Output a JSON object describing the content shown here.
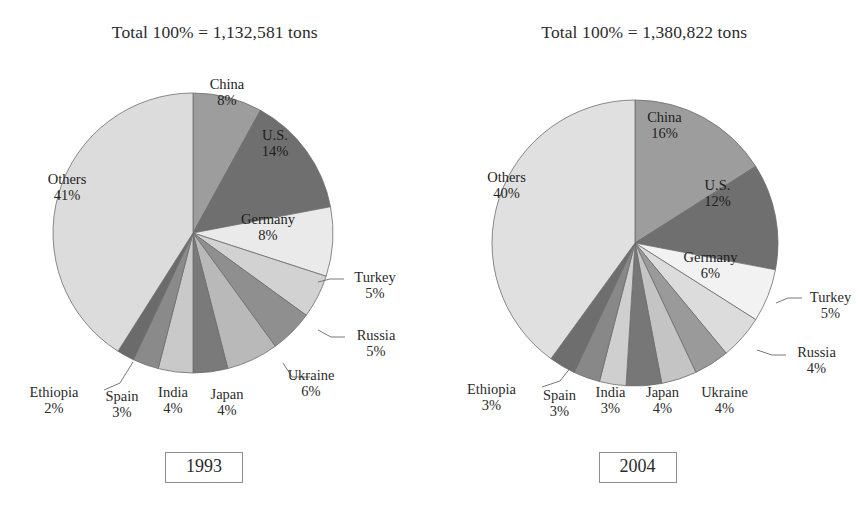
{
  "figure": {
    "background": "#ffffff",
    "text_color": "#2b2b2b"
  },
  "chart_data": [
    {
      "type": "pie",
      "id": "pie-1993",
      "title": "Total 100% = 1,132,581 tons",
      "caption": "1993",
      "total_tons": "1,132,581",
      "start_angle_deg": 0,
      "direction": "clockwise",
      "categories": [
        "China",
        "U.S.",
        "Germany",
        "Turkey",
        "Russia",
        "Ukraine",
        "Japan",
        "India",
        "Spain",
        "Ethiopia",
        "Others"
      ],
      "values": [
        8,
        14,
        8,
        5,
        5,
        6,
        4,
        4,
        3,
        2,
        41
      ],
      "value_labels": [
        "8%",
        "14%",
        "8%",
        "5%",
        "5%",
        "6%",
        "4%",
        "4%",
        "3%",
        "2%",
        "41%"
      ],
      "colors": [
        "#9d9d9d",
        "#6f6f6f",
        "#eaeaea",
        "#d2d2d2",
        "#8f8f8f",
        "#b9b9b9",
        "#7a7a7a",
        "#c9c9c9",
        "#8a8a8a",
        "#6b6b6b",
        "#dcdcdc"
      ],
      "legend": "none",
      "grid": false
    },
    {
      "type": "pie",
      "id": "pie-2004",
      "title": "Total 100% = 1,380,822 tons",
      "caption": "2004",
      "total_tons": "1,380,822",
      "start_angle_deg": 0,
      "direction": "clockwise",
      "categories": [
        "China",
        "U.S.",
        "Germany",
        "Turkey",
        "Russia",
        "Ukraine",
        "Japan",
        "India",
        "Spain",
        "Ethiopia",
        "Others"
      ],
      "values": [
        16,
        12,
        6,
        5,
        4,
        4,
        4,
        3,
        3,
        3,
        40
      ],
      "value_labels": [
        "16%",
        "12%",
        "6%",
        "5%",
        "4%",
        "4%",
        "4%",
        "3%",
        "3%",
        "3%",
        "40%"
      ],
      "colors": [
        "#9d9d9d",
        "#6f6f6f",
        "#f2f2f2",
        "#dcdcdc",
        "#9a9a9a",
        "#c4c4c4",
        "#777777",
        "#cfcfcf",
        "#888888",
        "#6e6e6e",
        "#e0e0e0"
      ],
      "legend": "none",
      "grid": false
    }
  ],
  "left": {
    "title": "Total 100% = 1,132,581 tons",
    "year": "1993",
    "labels": {
      "china_name": "China",
      "china_pct": "8%",
      "us_name": "U.S.",
      "us_pct": "14%",
      "germany_name": "Germany",
      "germany_pct": "8%",
      "turkey_name": "Turkey",
      "turkey_pct": "5%",
      "russia_name": "Russia",
      "russia_pct": "5%",
      "ukraine_name": "Ukraine",
      "ukraine_pct": "6%",
      "japan_name": "Japan",
      "japan_pct": "4%",
      "india_name": "India",
      "india_pct": "4%",
      "spain_name": "Spain",
      "spain_pct": "3%",
      "ethiopia_name": "Ethiopia",
      "ethiopia_pct": "2%",
      "others_name": "Others",
      "others_pct": "41%"
    }
  },
  "right": {
    "title": "Total 100% = 1,380,822 tons",
    "year": "2004",
    "labels": {
      "china_name": "China",
      "china_pct": "16%",
      "us_name": "U.S.",
      "us_pct": "12%",
      "germany_name": "Germany",
      "germany_pct": "6%",
      "turkey_name": "Turkey",
      "turkey_pct": "5%",
      "russia_name": "Russia",
      "russia_pct": "4%",
      "ukraine_name": "Ukraine",
      "ukraine_pct": "4%",
      "japan_name": "Japan",
      "japan_pct": "4%",
      "india_name": "India",
      "india_pct": "3%",
      "spain_name": "Spain",
      "spain_pct": "3%",
      "ethiopia_name": "Ethiopia",
      "ethiopia_pct": "3%",
      "others_name": "Others",
      "others_pct": "40%"
    }
  }
}
